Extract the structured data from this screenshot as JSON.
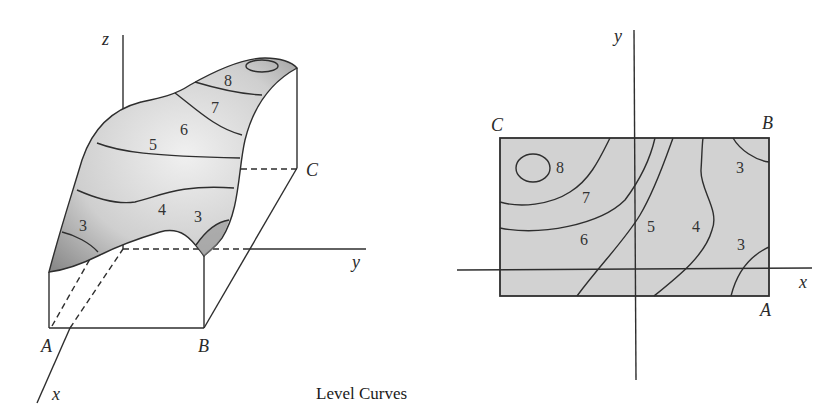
{
  "caption": "Level Curves",
  "colors": {
    "line": "#2e2e2e",
    "surface_light": "#e4e4e4",
    "surface_dark": "#8e8e8e",
    "map_fill": "#d2d2d2"
  },
  "surface_plot": {
    "axis_labels": {
      "z": "z",
      "y": "y",
      "x": "x"
    },
    "corner_labels": {
      "A": "A",
      "B": "B",
      "C": "C"
    },
    "level_labels": [
      "8",
      "7",
      "6",
      "5",
      "4",
      "3",
      "3"
    ]
  },
  "contour_map": {
    "axis_labels": {
      "y": "y",
      "x": "x"
    },
    "corner_labels": {
      "A": "A",
      "B": "B",
      "C": "C"
    },
    "level_labels": [
      "8",
      "7",
      "6",
      "5",
      "4",
      "3",
      "3"
    ]
  }
}
